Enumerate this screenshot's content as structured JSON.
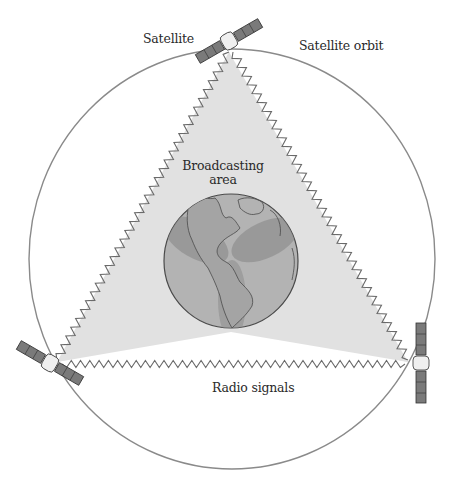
{
  "diagram": {
    "labels": {
      "satellite": "Satellite",
      "satellite_orbit": "Satellite orbit",
      "broadcasting_area_line1": "Broadcasting",
      "broadcasting_area_line2": "area",
      "radio_signals": "Radio signals"
    },
    "orbit": {
      "cx": 232,
      "cy": 259,
      "rx": 203,
      "ry": 210,
      "stroke": "#8a8a8a"
    },
    "earth": {
      "cx": 231,
      "cy": 261,
      "r": 67,
      "fill": "#a9a9a9",
      "stroke": "#4a4a4a"
    },
    "satellites": [
      {
        "name": "top",
        "x": 229,
        "y": 47,
        "angle": -30
      },
      {
        "name": "left",
        "x": 57,
        "y": 362,
        "angle": 30
      },
      {
        "name": "right",
        "x": 418,
        "y": 362,
        "angle": 90
      }
    ],
    "colors": {
      "coverage_cone": "#d9d9d9",
      "beam_overlap": "#8f8f8f",
      "zigzag": "#6f6f6f",
      "solar_panel": "#7a7a7a",
      "satellite_body": "#efefef"
    },
    "icons": [
      "satellite-icon",
      "earth-globe-icon",
      "radio-wave-icon"
    ]
  }
}
